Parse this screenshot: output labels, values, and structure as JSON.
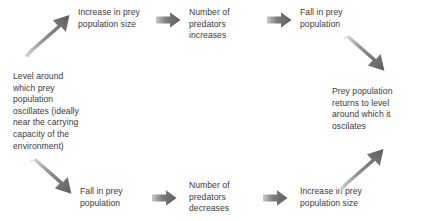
{
  "diagram": {
    "text_color": "#3a3a3a",
    "arrow_color": "#6e6e6e",
    "background": "#ffffff",
    "nodes": [
      {
        "id": "increase-prey-top",
        "label": "Increase in prey\npopulation size"
      },
      {
        "id": "predators-increase",
        "label": "Number of\npredators\nincreases"
      },
      {
        "id": "fall-prey-top",
        "label": "Fall in prey\npopulation"
      },
      {
        "id": "level-around",
        "label": "Level around\nwhich prey\npopulation\noscillates (ideally\nnear the carrying\ncapacity of the\nenvironment)"
      },
      {
        "id": "prey-returns",
        "label": "Prey population\nreturns to level\naround which it\noscilates"
      },
      {
        "id": "fall-prey-bottom",
        "label": "Fall in prey\npopulation"
      },
      {
        "id": "predators-decrease",
        "label": "Number of\npredators\ndecreases"
      },
      {
        "id": "increase-prey-bottom",
        "label": "Increase in prey\npopulation size"
      }
    ],
    "arrows": [
      {
        "id": "arrow-up-right-top-left",
        "direction": "up-right"
      },
      {
        "id": "arrow-right-increase-to-predators",
        "direction": "right"
      },
      {
        "id": "arrow-right-predators-to-fall",
        "direction": "right"
      },
      {
        "id": "arrow-down-right-top-right",
        "direction": "down-right"
      },
      {
        "id": "arrow-down-right-bottom-left",
        "direction": "down-right"
      },
      {
        "id": "arrow-right-fall-to-predators",
        "direction": "right"
      },
      {
        "id": "arrow-right-predators-to-increase",
        "direction": "right"
      },
      {
        "id": "arrow-up-right-bottom-right",
        "direction": "up-right"
      }
    ]
  }
}
